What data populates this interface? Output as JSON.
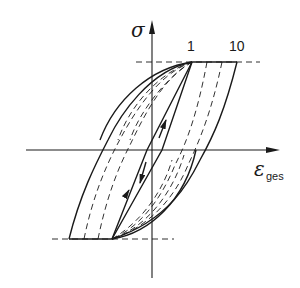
{
  "diagram": {
    "type": "hysteresis stress-strain diagram",
    "y_axis_label": "σ",
    "x_axis_label_main": "ε",
    "x_axis_label_sub": "ges",
    "curve_labels": [
      "1",
      "10"
    ],
    "colors": {
      "line": "#1a1a1a",
      "background": "#ffffff"
    }
  }
}
